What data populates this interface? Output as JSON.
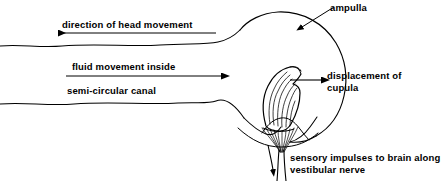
{
  "figure": {
    "background_color": "#ffffff",
    "stroke_color": "#000000",
    "width": 448,
    "height": 181
  },
  "labels": {
    "head_movement": "direction of head movement",
    "fluid_movement_line1": "fluid movement inside",
    "fluid_movement_line2": "semi-circular canal",
    "ampulla": "ampulla",
    "displacement_line1": "displacement of",
    "displacement_line2": "cupula",
    "sensory_line1": "sensory impulses to brain along",
    "sensory_line2": "vestibular nerve"
  },
  "arrows": {
    "head_movement_direction": "left",
    "fluid_movement_direction": "right",
    "cupula_displacement_direction": "right",
    "nerve_impulse_direction": "down",
    "ampulla_pointer_direction": "down-left"
  },
  "anatomy": {
    "canal_upper_wall": "semi-circular canal upper wall",
    "canal_lower_wall": "semi-circular canal lower wall",
    "ampulla_bulb": "ampulla bulb",
    "cupula": "cupula",
    "hair_cells": "hair cell bundle",
    "crista": "crista ampullaris",
    "vestibular_nerve": "vestibular nerve fibres"
  }
}
